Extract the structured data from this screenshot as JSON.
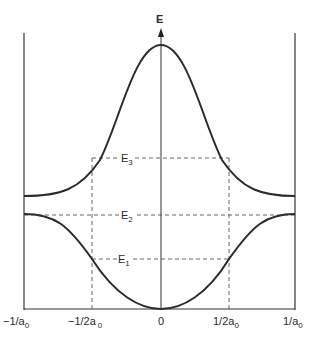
{
  "diagram": {
    "y_axis_label": "E",
    "x_tick_labels": [
      "−1/a",
      "−1/2a",
      "0",
      "1/2a",
      "1/a"
    ],
    "x_tick_subscript": "0",
    "energy_levels": [
      {
        "name": "E",
        "sub": "3",
        "desc": "upper band at ±1/2a0"
      },
      {
        "name": "E",
        "sub": "2",
        "desc": "band gap edge / lower band maximum"
      },
      {
        "name": "E",
        "sub": "1",
        "desc": "lower band at ±1/2a0"
      }
    ],
    "colors": {
      "curve": "#2b2b2b",
      "dashed": "#555555",
      "axis": "#333333",
      "background": "#ffffff"
    }
  }
}
